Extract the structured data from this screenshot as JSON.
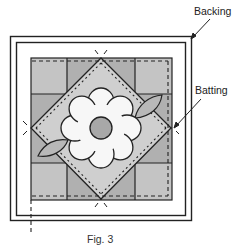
{
  "figure": {
    "caption": "Fig. 3",
    "labels": {
      "backing": "Backing",
      "batting": "Batting"
    },
    "colors": {
      "corner_square": "#c4c4c4",
      "edge_square": "#b0b0b0",
      "diamond_fill": "#cfcfcf",
      "flower_fill": "#f7f7f7",
      "flower_center": "#a8a8a8",
      "leaf_fill": "#b8b8b8",
      "outline": "#222222",
      "background": "#ffffff"
    },
    "layers": [
      {
        "name": "backing",
        "type": "outer rectangle"
      },
      {
        "name": "batting",
        "type": "inner rectangle"
      },
      {
        "name": "quilt-block",
        "type": "4x4 grid with on-point diamond, 8-petal flower and two leaves"
      }
    ],
    "annotations": [
      {
        "label": "Backing",
        "points_to": "backing outer corner (top-right)"
      },
      {
        "label": "Batting",
        "points_to": "right edge of block at basting line"
      }
    ]
  }
}
